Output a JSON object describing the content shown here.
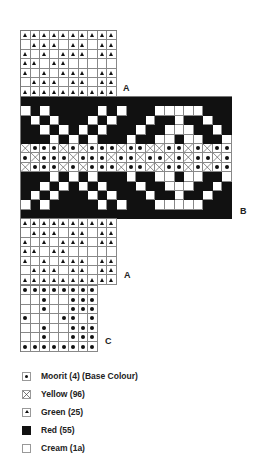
{
  "chart": {
    "labels": {
      "a_top": "A",
      "b": "B",
      "a_bottom": "A",
      "c": "C"
    },
    "top_grid": {
      "cols": 10,
      "rows": [
        "TTTTTTTTTT",
        "CTTTCTTCTT",
        "TCTCTTTCTT",
        "TTCTTCCCCC",
        "TCTCTTTCTT",
        "CTTTCTTCTT",
        "TTTTTTTTTT"
      ]
    },
    "band": {
      "cols": 22,
      "rows": [
        "RRRRRRRRRRRRRRRRRRRRRR",
        "CRCRRRRRCRCRRRCCCCCRRR",
        "RCRCRRRCRCRRRCRRCRRCRR",
        "RRCRCRCRCRRRCRRCCCRRCR",
        "RRRCRCRCRRRCRRCCRCCRRC",
        "XDDDXDXDDDXDDXXDDXDXDD",
        "DXDDDXDDDXDDXDDXDXDDXD",
        "XDDDXDXDDDXDDXXDDXDXDD",
        "RRRCRCRCRRRCRRCCRCCRRC",
        "RRCRCRCRCRRRCRRCCCRRCR",
        "RCRCRRRCRCRRRCRRCRRCRR",
        "CRCRRRRRCRCRRRCCCCCRRR",
        "RRRRRRRRRRRRRRRRRRRRRR"
      ]
    },
    "bottom_tri_grid": {
      "cols": 10,
      "rows": [
        "TTTTTTTTTT",
        "CTTTCTTCTT",
        "TCTCTTTCTT",
        "TTCTTCCCCC",
        "TCTCTTTCTT",
        "CTTTCTTCTT",
        "TTTTTTTTTT"
      ]
    },
    "bottom_dot_grid": {
      "cols": 8,
      "rows": [
        "DDDDDDDD",
        "CCDCCDDD",
        "CCDCCDDD",
        "DCCCDDCD",
        "CCDCCDDD",
        "CCDCCDDD",
        "DDDDDDDD"
      ]
    },
    "symbol_key": {
      "D": "dot",
      "X": "cross",
      "T": "triangle",
      "R": "solid",
      "C": "empty"
    }
  },
  "legend": {
    "items": [
      {
        "symbol": "dot",
        "label": "Moorit (4) (Base Colour)"
      },
      {
        "symbol": "cross",
        "label": "Yellow (96)"
      },
      {
        "symbol": "triangle",
        "label": "Green (25)"
      },
      {
        "symbol": "solid",
        "label": "Red (55)"
      },
      {
        "symbol": "empty",
        "label": "Cream (1a)"
      }
    ]
  },
  "colors": {
    "red_fill": "#111111",
    "cream_fill": "#ffffff",
    "grid_line": "#888888"
  }
}
